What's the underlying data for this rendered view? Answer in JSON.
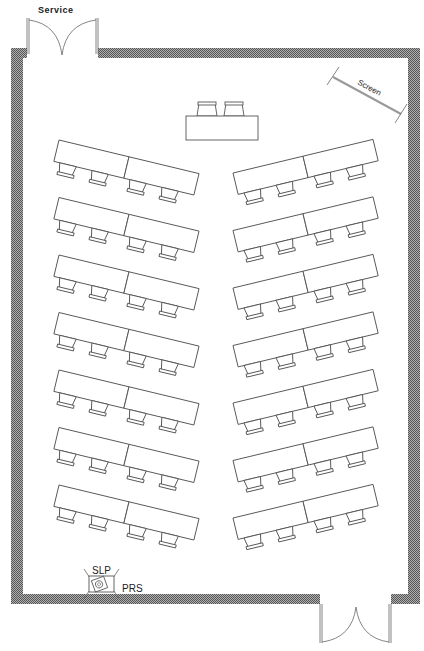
{
  "labels": {
    "service_door": "Service",
    "screen": "Screen",
    "slp": "SLP",
    "prs": "PRS"
  },
  "room": {
    "head_table": {
      "chairs": 2
    },
    "rows_per_side": 7,
    "sides": [
      "left",
      "right"
    ],
    "tables_per_row": 2,
    "chairs_per_table": 2
  },
  "colors": {
    "wall": "#8a8a8a",
    "line": "#555555",
    "screen": "#999999"
  }
}
